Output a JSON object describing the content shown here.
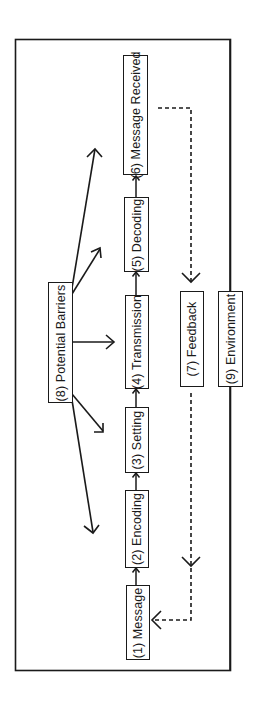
{
  "diagram": {
    "orientation": "rotated-90-ccw",
    "colors": {
      "stroke": "#1a1a1a",
      "background": "#ffffff"
    },
    "frame": {
      "label": ""
    },
    "nodes": {
      "message": {
        "num": "(1)",
        "text": "Message",
        "label": "(1)  Message"
      },
      "encoding": {
        "num": "(2)",
        "text": "Encoding",
        "label": "(2)  Encoding"
      },
      "setting": {
        "num": "(3)",
        "text": "Setting",
        "label": "(3)  Setting"
      },
      "transmission": {
        "num": "(4)",
        "text": "Transmission",
        "label": "(4)  Transmission"
      },
      "decoding": {
        "num": "(5)",
        "text": "Decoding",
        "label": "(5)  Decoding"
      },
      "message_received": {
        "num": "(6)",
        "text": "Message Received",
        "label": "(6)  Message Received"
      },
      "feedback": {
        "num": "(7)",
        "text": "Feedback",
        "label": "(7)  Feedback"
      },
      "potential_barriers": {
        "num": "(8)",
        "text": "Potential Barriers",
        "label": "(8)  Potential Barriers"
      },
      "environment": {
        "num": "(9)",
        "text": "Environment",
        "label": "(9)  Environment"
      }
    },
    "edges": [
      {
        "from": "(1) Message",
        "to": "(2) Encoding",
        "style": "solid"
      },
      {
        "from": "(2) Encoding",
        "to": "(3) Setting",
        "style": "solid"
      },
      {
        "from": "(3) Setting",
        "to": "(4) Transmission",
        "style": "solid"
      },
      {
        "from": "(4) Transmission",
        "to": "(5) Decoding",
        "style": "solid"
      },
      {
        "from": "(5) Decoding",
        "to": "(6) Message Received",
        "style": "solid"
      },
      {
        "from": "(6) Message Received",
        "to": "(7) Feedback",
        "style": "dashed"
      },
      {
        "from": "(7) Feedback",
        "to": "(1) Message",
        "style": "dashed"
      },
      {
        "from": "(8) Potential Barriers",
        "to": "process",
        "style": "solid",
        "count": 5
      },
      {
        "from": "(9) Environment",
        "to": "frame",
        "style": "solid"
      }
    ]
  }
}
